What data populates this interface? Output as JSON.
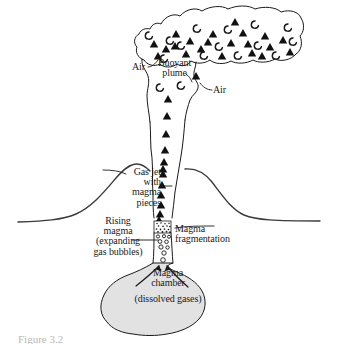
{
  "figure": {
    "caption": "Figure 3.2"
  },
  "labels": {
    "air_left": "Air",
    "air_right": "Air",
    "buoyant_plume": "Buoyant\nplume",
    "gas_jet": "Gas jet\nwith\nmagma\npieces",
    "rising_magma": "Rising\nmagma\n(expanding\ngas bubbles)",
    "magma_fragmentation": "Magma\nfragmentation",
    "magma_chamber": "Magma\nchamber",
    "dissolved_gases": "(dissolved gases)"
  },
  "colors": {
    "background": "#ffffff",
    "outline": "#1a1a1a",
    "text": "#1a1a1a",
    "chamber_fill": "#e2e2e2",
    "ground_line": "#3a3a3a",
    "particle_fill": "#111111",
    "caption_text": "#b9b9b9"
  },
  "diagram_data": {
    "type": "cross-section-diagram",
    "regions": [
      {
        "name": "buoyant-plume",
        "description": "Wide irregular cloud at top containing ash triangles and gas arcs"
      },
      {
        "name": "gas-jet",
        "description": "Narrow vertical column of magma pieces rising from the vent"
      },
      {
        "name": "volcano-cone",
        "description": "Conical edifice with ground surface extending to both sides"
      },
      {
        "name": "fragmentation-zone",
        "description": "Stippled band in the conduit where magma fragments"
      },
      {
        "name": "bubble-zone",
        "description": "Rising magma with expanding gas bubbles below fragmentation"
      },
      {
        "name": "magma-chamber",
        "description": "Gray filled reservoir holding dissolved gases"
      }
    ],
    "plume_particles": {
      "triangles": 22,
      "gas_arcs": 16
    },
    "conduit_particles": {
      "triangles": 12,
      "bubbles": 9
    }
  }
}
